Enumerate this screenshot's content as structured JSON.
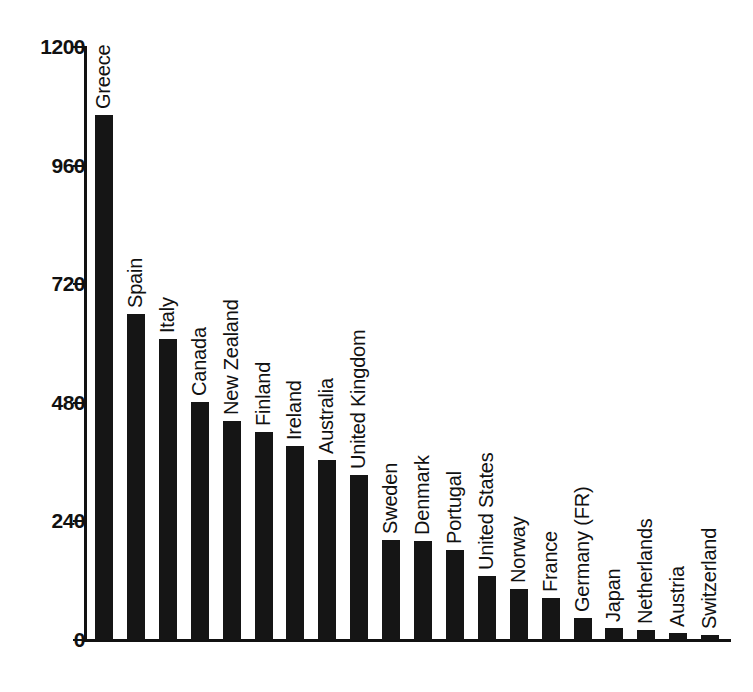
{
  "chart_data": {
    "type": "bar",
    "title": "",
    "subtitle": "",
    "xlabel": "",
    "ylabel": "",
    "ylim": [
      0,
      1200
    ],
    "yticks": [
      0,
      240,
      480,
      720,
      960,
      1200
    ],
    "ytick_labels": [
      "0",
      "240",
      "480",
      "720",
      "960",
      "1200"
    ],
    "grid": false,
    "legend": null,
    "orientation": "vertical",
    "bar_color": "#151515",
    "axis_color": "#111111",
    "background_color": "#ffffff",
    "label_rotation": -90,
    "categories": [
      "Greece",
      "Spain",
      "Italy",
      "Canada",
      "New Zealand",
      "Finland",
      "Ireland",
      "Australia",
      "United Kingdom",
      "Sweden",
      "Denmark",
      "Portugal",
      "United States",
      "Norway",
      "France",
      "Germany (FR)",
      "Japan",
      "Netherlands",
      "Austria",
      "Switzerland"
    ],
    "values": [
      1063,
      660,
      610,
      482,
      444,
      420,
      392,
      365,
      334,
      202,
      200,
      182,
      130,
      103,
      85,
      45,
      25,
      20,
      14,
      10
    ]
  }
}
